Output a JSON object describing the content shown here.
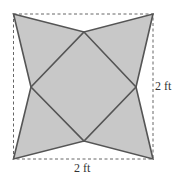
{
  "diagram": {
    "type": "geometry-figure",
    "labels": {
      "right_side": "2 ft",
      "bottom_side": "2 ft"
    },
    "colors": {
      "fill": "#c8c8c8",
      "stroke": "#555555",
      "dashed_outline": "#666666"
    }
  }
}
